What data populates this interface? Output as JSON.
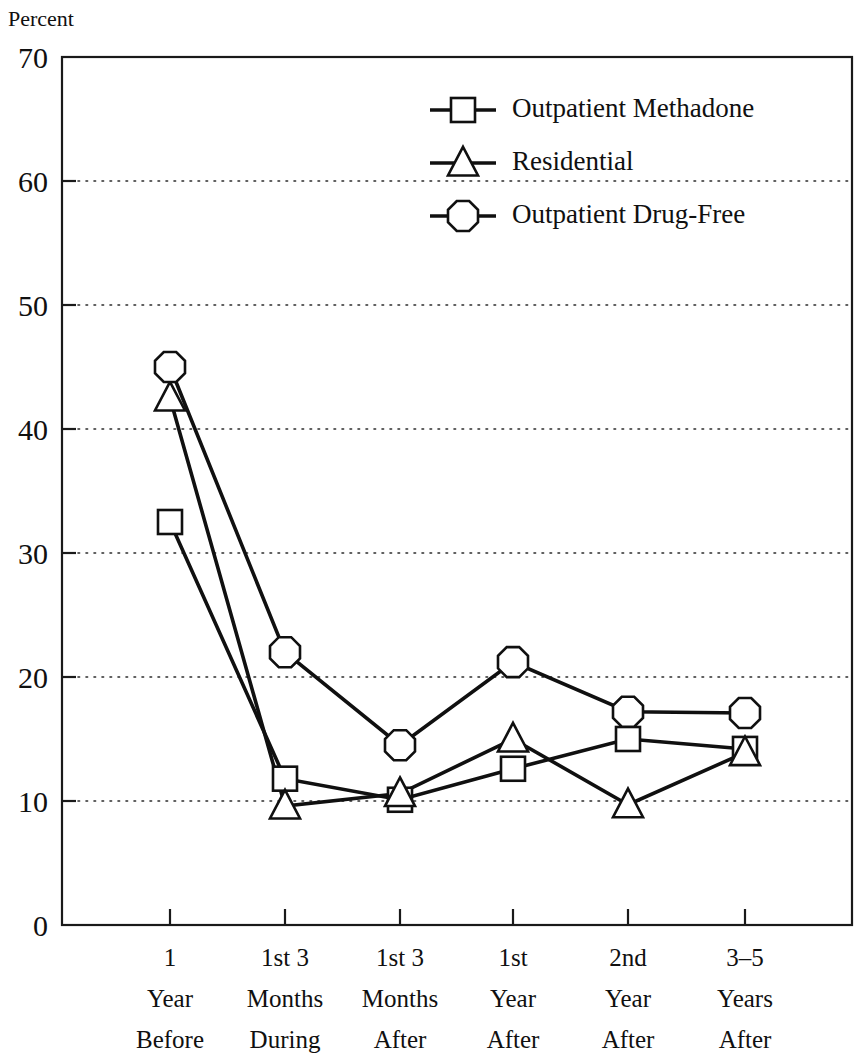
{
  "chart_data": {
    "type": "line",
    "title": "",
    "ylabel": "Percent",
    "xlabel": "",
    "ylim": [
      0,
      70
    ],
    "yticks": [
      0,
      10,
      20,
      30,
      40,
      50,
      60,
      70
    ],
    "ytick_labels": [
      "0",
      "10",
      "20",
      "30",
      "40",
      "50",
      "60",
      "70"
    ],
    "grid": "horizontal-dotted",
    "legend_position": "upper-center-right",
    "categories": [
      "1 Year Before",
      "1st 3 Months During",
      "1st 3 Months After",
      "1st Year After",
      "2nd Year After",
      "3-5 Years After"
    ],
    "category_lines": [
      [
        "1",
        "Year",
        "Before"
      ],
      [
        "1st 3",
        "Months",
        "During"
      ],
      [
        "1st 3",
        "Months",
        "After"
      ],
      [
        "1st",
        "Year",
        "After"
      ],
      [
        "2nd",
        "Year",
        "After"
      ],
      [
        "3–5",
        "Years",
        "After"
      ]
    ],
    "series": [
      {
        "name": "Outpatient Methadone",
        "marker": "square",
        "values": [
          32.5,
          11.8,
          10.1,
          12.6,
          15.0,
          14.2
        ]
      },
      {
        "name": "Residential",
        "marker": "triangle",
        "values": [
          42.5,
          9.6,
          10.6,
          15.0,
          9.7,
          13.9
        ]
      },
      {
        "name": "Outpatient Drug-Free",
        "marker": "octagon",
        "values": [
          45.0,
          22.0,
          14.5,
          21.2,
          17.2,
          17.1
        ]
      }
    ],
    "colors": {
      "line": "#101010",
      "marker_fill": "#ffffff",
      "grid": "#2b2b2b",
      "frame": "#1a1a1a",
      "background": "#ffffff"
    }
  }
}
